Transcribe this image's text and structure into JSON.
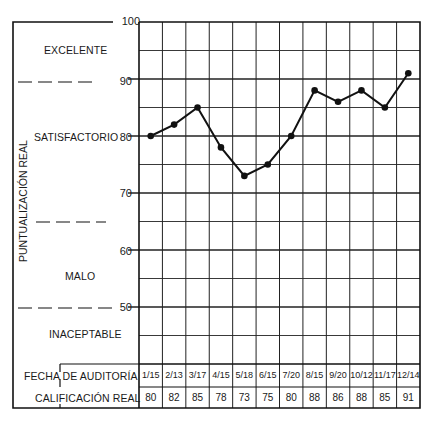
{
  "chart_data": {
    "type": "line",
    "title": "",
    "xlabel": "FECHA DE AUDITORÍA",
    "ylabel": "PUNTUALIZACIÓN REAL",
    "ylim": [
      40,
      100
    ],
    "yticks": [
      100,
      90,
      80,
      70,
      60,
      50
    ],
    "grid": true,
    "categories": [
      "1/15",
      "2/13",
      "3/17",
      "4/15",
      "5/18",
      "6/15",
      "7/20",
      "8/15",
      "9/20",
      "10/12",
      "11/17",
      "12/14"
    ],
    "series": [
      {
        "name": "CALIFICACIÓN REAL",
        "values": [
          80,
          82,
          85,
          78,
          73,
          75,
          80,
          88,
          86,
          88,
          85,
          91
        ]
      }
    ],
    "zones": [
      {
        "label": "EXCELENTE",
        "range": [
          90,
          100
        ]
      },
      {
        "label": "SATISFACTORIO",
        "range": [
          65,
          90
        ]
      },
      {
        "label": "MALO",
        "range": [
          50,
          65
        ]
      },
      {
        "label": "INACEPTABLE",
        "range": [
          40,
          50
        ]
      }
    ],
    "table_rows": [
      {
        "label": "FECHA DE AUDITORÍA",
        "values": [
          "1/15",
          "2/13",
          "3/17",
          "4/15",
          "5/18",
          "6/15",
          "7/20",
          "8/15",
          "9/20",
          "10/12",
          "11/17",
          "12/14"
        ]
      },
      {
        "label": "CALIFICACIÓN REAL",
        "values": [
          "80",
          "82",
          "85",
          "78",
          "73",
          "75",
          "80",
          "88",
          "86",
          "88",
          "85",
          "91"
        ]
      }
    ]
  },
  "labels": {
    "y_axis": "PUNTUALIZACIÓN REAL",
    "zone_excelente": "EXCELENTE",
    "zone_satisfactorio": "SATISFACTORIO",
    "zone_malo": "MALO",
    "zone_inaceptable": "INACEPTABLE",
    "row_fecha": "FECHA DE AUDITORÍA",
    "row_calificacion": "CALIFICACIÓN REAL"
  },
  "ticks": [
    "100",
    "90",
    "80",
    "70",
    "60",
    "50"
  ]
}
